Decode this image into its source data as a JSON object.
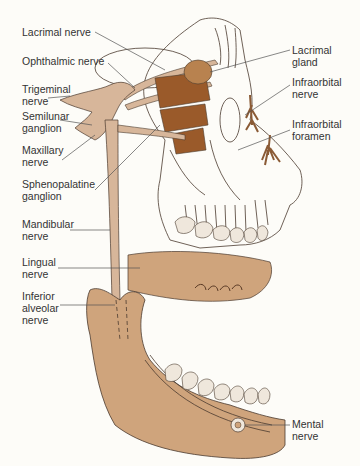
{
  "diagram": {
    "colors": {
      "background": "#fdfcf8",
      "nerve_tan": "#d7b69a",
      "bone_tan": "#cfa47c",
      "muscle_brown": "#9a5a2a",
      "gland_brown": "#b8824f",
      "teeth": "#efe7dc",
      "outline": "#4a3a2e",
      "leader_line": "#555555",
      "label_text": "#333333"
    },
    "labels": {
      "lacrimal_nerve": "Lacrimal nerve",
      "ophthalmic_nerve": "Ophthalmic nerve",
      "trigeminal_nerve_1": "Trigeminal",
      "trigeminal_nerve_2": "nerve",
      "semilunar_ganglion_1": "Semilunar",
      "semilunar_ganglion_2": "ganglion",
      "maxillary_nerve_1": "Maxillary",
      "maxillary_nerve_2": "nerve",
      "sphenopalatine_ganglion_1": "Sphenopalatine",
      "sphenopalatine_ganglion_2": "ganglion",
      "mandibular_nerve_1": "Mandibular",
      "mandibular_nerve_2": "nerve",
      "lingual_nerve_1": "Lingual",
      "lingual_nerve_2": "nerve",
      "inferior_alveolar_nerve_1": "Inferior",
      "inferior_alveolar_nerve_2": "alveolar",
      "inferior_alveolar_nerve_3": "nerve",
      "lacrimal_gland_1": "Lacrimal",
      "lacrimal_gland_2": "gland",
      "infraorbital_nerve_1": "Infraorbital",
      "infraorbital_nerve_2": "nerve",
      "infraorbital_foramen_1": "Infraorbital",
      "infraorbital_foramen_2": "foramen",
      "mental_nerve_1": "Mental",
      "mental_nerve_2": "nerve"
    }
  }
}
